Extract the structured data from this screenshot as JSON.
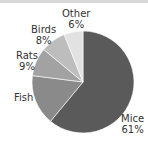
{
  "chart_data": {
    "type": "pie",
    "title": "",
    "categories": [
      "Mice",
      "Fish",
      "Rats",
      "Birds",
      "Other"
    ],
    "values": [
      61,
      16,
      9,
      8,
      6
    ],
    "labels": [
      {
        "name": "Mice",
        "pct": "61%"
      },
      {
        "name": "Fish",
        "pct": ""
      },
      {
        "name": "Rats",
        "pct": "9%"
      },
      {
        "name": "Birds",
        "pct": "8%"
      },
      {
        "name": "Other",
        "pct": "6%"
      }
    ],
    "colors": [
      "#5a5a5a",
      "#8a8a8a",
      "#a2a2a2",
      "#bdbdbd",
      "#e2e2e2"
    ],
    "legend": "none (direct labels)"
  }
}
